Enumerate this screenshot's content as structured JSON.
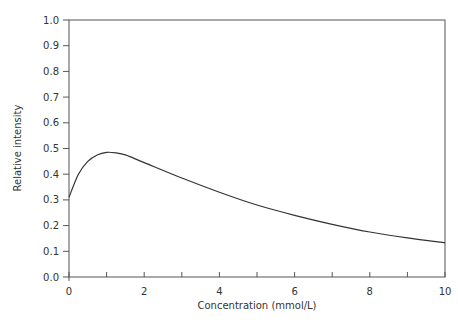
{
  "chart_data": {
    "type": "line",
    "title": "",
    "xlabel": "Concentration (mmol/L)",
    "ylabel": "Relative intensity",
    "xlim": [
      0,
      10
    ],
    "ylim": [
      0.0,
      1.0
    ],
    "x_ticks": [
      "0",
      "2",
      "4",
      "6",
      "8",
      "10"
    ],
    "y_ticks": [
      "0.0",
      "0.1",
      "0.2",
      "0.3",
      "0.4",
      "0.5",
      "0.6",
      "0.7",
      "0.8",
      "0.9",
      "1.0"
    ],
    "grid": false,
    "legend": null,
    "series": [
      {
        "name": "Relative intensity",
        "x": [
          0,
          0.25,
          0.5,
          0.75,
          1.0,
          1.25,
          1.5,
          2,
          3,
          4,
          5,
          6,
          7,
          8,
          9,
          10
        ],
        "values": [
          0.31,
          0.4,
          0.45,
          0.475,
          0.485,
          0.483,
          0.475,
          0.445,
          0.385,
          0.33,
          0.28,
          0.24,
          0.205,
          0.175,
          0.152,
          0.133
        ]
      }
    ]
  },
  "axes": {
    "xlabel": "Concentration (mmol/L)",
    "ylabel": "Relative intensity"
  }
}
